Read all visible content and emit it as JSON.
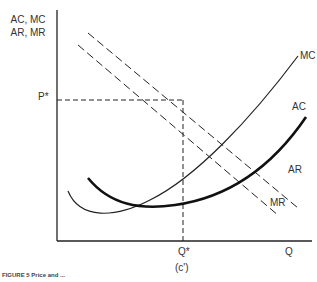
{
  "figure": {
    "y_axis_label_line1": "AC, MC",
    "y_axis_label_line2": "AR, MR",
    "x_axis_label": "Q",
    "price_label": "P*",
    "quantity_label": "Q*",
    "panel_label": "(c')",
    "caption": "FIGURE 5  Price and ...",
    "curves": {
      "mc": "MC",
      "ac": "AC",
      "ar": "AR",
      "mr": "MR"
    }
  }
}
